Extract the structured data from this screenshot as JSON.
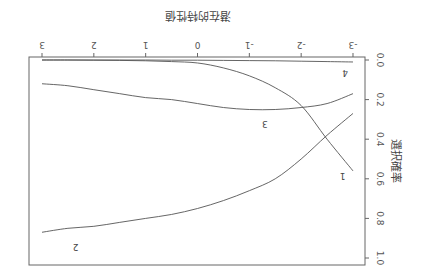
{
  "chart_data": {
    "type": "line",
    "orientation_note": "figure rendered rotated 180 degrees",
    "title": "",
    "xlabel": "潜在的特性値",
    "ylabel": "選択確率",
    "xlim": [
      -3,
      3
    ],
    "ylim": [
      0.0,
      1.0
    ],
    "xticks": [
      "-3",
      "-2",
      "-1",
      "0",
      "1",
      "2",
      "3"
    ],
    "yticks": [
      "0.0",
      "0.2",
      "0.4",
      "0.6",
      "0.8",
      "1.0"
    ],
    "grid": false,
    "legend": "none (curves labeled inline)",
    "x": [
      -3,
      -2.5,
      -2,
      -1.5,
      -1,
      -0.5,
      0,
      0.5,
      1,
      1.5,
      2,
      2.5,
      3
    ],
    "series": [
      {
        "name": "1",
        "label_pos": [
          -2.8,
          0.57
        ],
        "values": [
          0.56,
          0.4,
          0.23,
          0.14,
          0.08,
          0.04,
          0.015,
          0.008,
          0.004,
          0.002,
          0.001,
          0.0,
          0.0
        ]
      },
      {
        "name": "2",
        "label_pos": [
          2.35,
          0.93
        ],
        "values": [
          0.27,
          0.38,
          0.5,
          0.6,
          0.66,
          0.71,
          0.75,
          0.78,
          0.8,
          0.82,
          0.84,
          0.85,
          0.87
        ]
      },
      {
        "name": "3",
        "label_pos": [
          -1.3,
          0.31
        ],
        "values": [
          0.17,
          0.22,
          0.24,
          0.25,
          0.25,
          0.24,
          0.22,
          0.2,
          0.19,
          0.17,
          0.15,
          0.13,
          0.12
        ]
      },
      {
        "name": "4",
        "label_pos": [
          -2.85,
          0.05
        ],
        "values": [
          0.01,
          0.008,
          0.006,
          0.004,
          0.003,
          0.002,
          0.001,
          0.001,
          0.0,
          0.0,
          0.0,
          0.0,
          0.0
        ]
      }
    ]
  }
}
